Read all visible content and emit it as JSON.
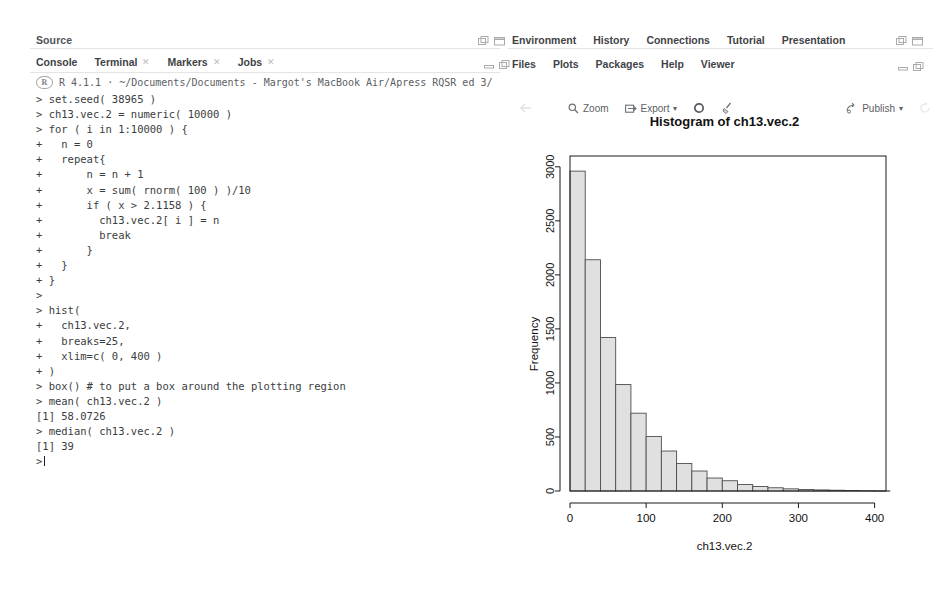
{
  "window": {
    "source_pane": {
      "title": "Source"
    },
    "left_pane": {
      "tabs": [
        {
          "label": "Console",
          "closable": false
        },
        {
          "label": "Terminal",
          "closable": true
        },
        {
          "label": "Markers",
          "closable": true
        },
        {
          "label": "Jobs",
          "closable": true
        }
      ],
      "active_tab": "Console",
      "r_version": "R 4.1.1",
      "working_directory": "~/Documents/Documents - Margot's MacBook Air/Apress RQSR ed 3/",
      "console_lines": [
        "> set.seed( 38965 )",
        "> ch13.vec.2 = numeric( 10000 )",
        "> for ( i in 1:10000 ) {",
        "+   n = 0",
        "+   repeat{",
        "+       n = n + 1",
        "+       x = sum( rnorm( 100 ) )/10",
        "+       if ( x > 2.1158 ) {",
        "+         ch13.vec.2[ i ] = n",
        "+         break",
        "+       }",
        "+   }",
        "+ }",
        ">",
        "> hist(",
        "+   ch13.vec.2,",
        "+   breaks=25,",
        "+   xlim=c( 0, 400 )",
        "+ )",
        "> box() # to put a box around the plotting region",
        "> mean( ch13.vec.2 )",
        "[1] 58.0726",
        "> median( ch13.vec.2 )",
        "[1] 39",
        ">"
      ]
    },
    "right_pane": {
      "top_tabs": [
        {
          "label": "Environment"
        },
        {
          "label": "History"
        },
        {
          "label": "Connections"
        },
        {
          "label": "Tutorial"
        },
        {
          "label": "Presentation"
        }
      ],
      "bottom_tabs": [
        {
          "label": "Files"
        },
        {
          "label": "Plots"
        },
        {
          "label": "Packages"
        },
        {
          "label": "Help"
        },
        {
          "label": "Viewer"
        }
      ],
      "active_tab": "Plots",
      "plot_toolbar": {
        "back_label": "",
        "zoom_label": "Zoom",
        "export_label": "Export",
        "export_caret": "▾",
        "remove_label": "",
        "clear_label": "",
        "publish_label": "Publish",
        "publish_caret": "▾",
        "refresh_label": ""
      }
    }
  },
  "icons": {
    "minimize": "minimize-icon",
    "maximize": "maximize-icon",
    "search": "search-icon",
    "gear": "gear-icon",
    "broom": "broom-icon",
    "publish": "publish-icon",
    "refresh": "refresh-icon",
    "back_arrow": "back-arrow-icon",
    "export": "export-icon"
  },
  "colors": {
    "bar_fill": "#e0e0e0",
    "bar_stroke": "#4d4d4d",
    "axis": "#1a1a1a",
    "tab_text": "#3f4347",
    "console_text": "#3a3d40",
    "muted": "#9fa3a7"
  },
  "chart_data": {
    "type": "bar",
    "title": "Histogram of ch13.vec.2",
    "xlabel": "ch13.vec.2",
    "ylabel": "Frequency",
    "xlim": [
      0,
      415
    ],
    "ylim": [
      0,
      3100
    ],
    "xticks": [
      0,
      100,
      200,
      300,
      400
    ],
    "yticks": [
      0,
      500,
      1000,
      1500,
      2000,
      2500,
      3000
    ],
    "grid": false,
    "legend": null,
    "bin_width": 20,
    "bin_starts": [
      0,
      20,
      40,
      60,
      80,
      100,
      120,
      140,
      160,
      180,
      200,
      220,
      240,
      260,
      280,
      300,
      320,
      340,
      360,
      380,
      400
    ],
    "categories": [
      "0-20",
      "20-40",
      "40-60",
      "60-80",
      "80-100",
      "100-120",
      "120-140",
      "140-160",
      "160-180",
      "180-200",
      "200-220",
      "220-240",
      "240-260",
      "260-280",
      "280-300",
      "300-320",
      "320-340",
      "340-360",
      "360-380",
      "380-400",
      "400-420"
    ],
    "values": [
      2960,
      2140,
      1420,
      985,
      720,
      505,
      370,
      255,
      185,
      120,
      95,
      60,
      42,
      30,
      20,
      14,
      10,
      7,
      5,
      3,
      2
    ]
  }
}
